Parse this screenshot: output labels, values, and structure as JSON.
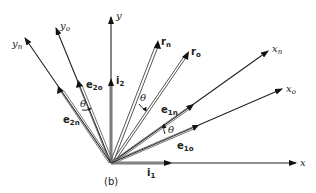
{
  "figure": {
    "caption": "(b)"
  },
  "axes": {
    "x": {
      "label": "x",
      "unit_vector": {
        "base": "i",
        "sub": "1"
      }
    },
    "y": {
      "label": "y",
      "unit_vector": {
        "base": "i",
        "sub": "2"
      }
    },
    "x_o": {
      "label": "x",
      "sub": "o",
      "unit_vector": {
        "base": "e",
        "sub": "1o"
      }
    },
    "y_o": {
      "label": "y",
      "sub": "o",
      "unit_vector": {
        "base": "e",
        "sub": "2o"
      }
    },
    "x_n": {
      "label": "x",
      "sub": "n",
      "unit_vector": {
        "base": "e",
        "sub": "1n"
      }
    },
    "y_n": {
      "label": "y",
      "sub": "n",
      "unit_vector": {
        "base": "e",
        "sub": "2n"
      }
    }
  },
  "vectors": {
    "r_o": {
      "label": "r",
      "sub": "o"
    },
    "r_n": {
      "label": "r",
      "sub": "n"
    }
  },
  "angles": {
    "theta_label": "θ",
    "count": 3
  },
  "colors": {
    "line": "#222222",
    "double_line": "#555555",
    "background": "#ffffff"
  }
}
